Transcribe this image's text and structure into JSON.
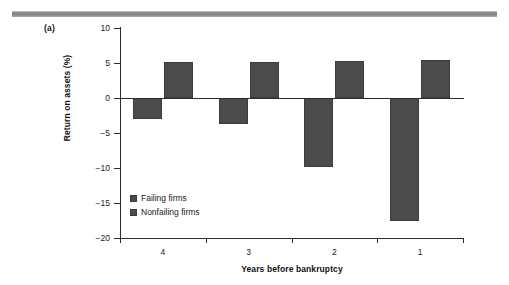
{
  "figure": {
    "panel_label": "(a)",
    "rule_color": "#8a8a8a",
    "bar_color": "#4b4b4b",
    "axis_color": "#2c2c2c"
  },
  "chart_data": {
    "type": "bar",
    "title": "",
    "subtitle": "",
    "xlabel": "Years before bankruptcy",
    "ylabel": "Return on assets (%)",
    "categories": [
      "4",
      "3",
      "2",
      "1"
    ],
    "series": [
      {
        "name": "Failing firms",
        "values": [
          -3.0,
          -3.7,
          -9.9,
          -17.6
        ]
      },
      {
        "name": "Nonfailing firms",
        "values": [
          5.1,
          5.2,
          5.3,
          5.4
        ]
      }
    ],
    "ylim": [
      -20,
      10
    ],
    "yticks": [
      10,
      5,
      0,
      -5,
      -10,
      -15,
      -20
    ],
    "yticklabels": [
      "10",
      "5",
      "0",
      "−5",
      "−10",
      "−15",
      "−20"
    ],
    "grid": false,
    "legend_position": "inside-lower-left",
    "zero_line": true
  },
  "legend": {
    "items": [
      {
        "label": "Failing firms",
        "color": "#4b4b4b"
      },
      {
        "label": "Nonfailing firms",
        "color": "#4b4b4b"
      }
    ]
  }
}
